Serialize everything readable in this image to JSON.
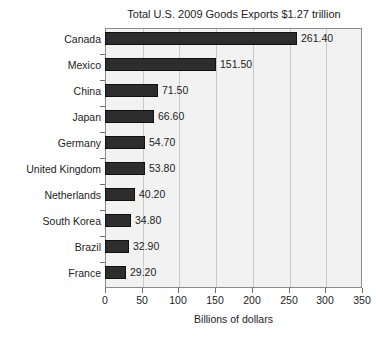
{
  "chart_data": {
    "type": "bar",
    "orientation": "horizontal",
    "title": "Total U.S. 2009 Goods Exports $1.27 trillion",
    "xlabel": "Billions of dollars",
    "ylabel": "",
    "categories": [
      "Canada",
      "Mexico",
      "China",
      "Japan",
      "Germany",
      "United Kingdom",
      "Netherlands",
      "South Korea",
      "Brazil",
      "France"
    ],
    "values": [
      261.4,
      151.5,
      71.5,
      66.6,
      54.7,
      53.8,
      40.2,
      34.8,
      32.9,
      29.2
    ],
    "value_labels": [
      "261.40",
      "151.50",
      "71.50",
      "66.60",
      "54.70",
      "53.80",
      "40.20",
      "34.80",
      "32.90",
      "29.20"
    ],
    "xlim": [
      0,
      350
    ],
    "xticks": [
      0,
      50,
      100,
      150,
      200,
      250,
      300,
      350
    ],
    "xtick_labels": [
      "0",
      "50",
      "100",
      "150",
      "200",
      "250",
      "300",
      "350"
    ],
    "grid": "vertical",
    "legend": "none",
    "colors": {
      "bar": "#2d2d2d",
      "bar_edge": "#111111",
      "plot_background": "#f2f2f2",
      "gridline": "#c9c9c9",
      "axis": "#8a8a8a",
      "text": "#1d1d1d",
      "page_background": "#ffffff"
    }
  }
}
